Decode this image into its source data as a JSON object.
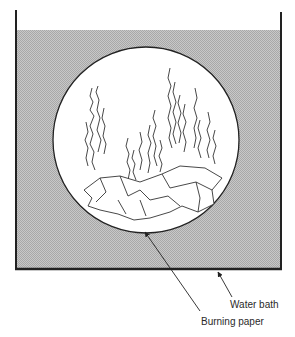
{
  "diagram": {
    "labels": {
      "water_bath": "Water bath",
      "burning_paper": "Burning paper"
    },
    "colors": {
      "water": "#b9b9b9",
      "line": "#222222",
      "background": "#ffffff"
    }
  }
}
